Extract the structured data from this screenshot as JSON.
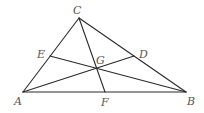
{
  "diagram": {
    "type": "triangle-with-cevians",
    "stroke_color": "#2a2a2a",
    "label_color": "#555555",
    "points": {
      "A": {
        "x": 23,
        "y": 92,
        "label": "A",
        "lx": 14,
        "ly": 105
      },
      "B": {
        "x": 186,
        "y": 92,
        "label": "B",
        "lx": 187,
        "ly": 105
      },
      "C": {
        "x": 79,
        "y": 18,
        "label": "C",
        "lx": 73,
        "ly": 14
      },
      "D": {
        "x": 134,
        "y": 56,
        "label": "D",
        "lx": 139,
        "ly": 58
      },
      "E": {
        "x": 50,
        "y": 56,
        "label": "E",
        "lx": 37,
        "ly": 58
      },
      "F": {
        "x": 105,
        "y": 92,
        "label": "F",
        "lx": 101,
        "ly": 106
      },
      "G": {
        "x": 96,
        "y": 68,
        "label": "G",
        "lx": 96,
        "ly": 64
      }
    },
    "segments": [
      {
        "name": "side-ab",
        "from": "A",
        "to": "B"
      },
      {
        "name": "side-ac",
        "from": "A",
        "to": "C"
      },
      {
        "name": "side-bc",
        "from": "B",
        "to": "C"
      },
      {
        "name": "cevian-cf",
        "from": "C",
        "to": "F"
      },
      {
        "name": "cevian-ad",
        "from": "A",
        "to": "D"
      },
      {
        "name": "cevian-be",
        "from": "B",
        "to": "E"
      }
    ]
  }
}
